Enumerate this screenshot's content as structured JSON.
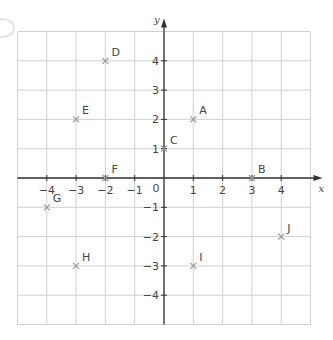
{
  "chart_data": {
    "type": "scatter",
    "title": "",
    "xlabel": "x",
    "ylabel": "y",
    "xlim": [
      -5,
      5
    ],
    "ylim": [
      -5,
      5
    ],
    "grid": true,
    "x_ticks": [
      "-4",
      "-3",
      "-2",
      "-1",
      "1",
      "2",
      "3",
      "4"
    ],
    "y_ticks": [
      "4",
      "3",
      "2",
      "1",
      "-1",
      "-2",
      "-3",
      "-4"
    ],
    "origin_label": "0",
    "points": [
      {
        "label": "A",
        "x": 1,
        "y": 2
      },
      {
        "label": "B",
        "x": 3,
        "y": 0
      },
      {
        "label": "C",
        "x": 0,
        "y": 1
      },
      {
        "label": "D",
        "x": -2,
        "y": 4
      },
      {
        "label": "E",
        "x": -3,
        "y": 2
      },
      {
        "label": "F",
        "x": -2,
        "y": 0
      },
      {
        "label": "G",
        "x": -4,
        "y": -1
      },
      {
        "label": "H",
        "x": -3,
        "y": -3
      },
      {
        "label": "I",
        "x": 1,
        "y": -3
      },
      {
        "label": "J",
        "x": 4,
        "y": -2
      }
    ]
  },
  "colors": {
    "grid": "#d0d0d0",
    "axis": "#333333",
    "point": "#999999",
    "text": "#444444"
  }
}
